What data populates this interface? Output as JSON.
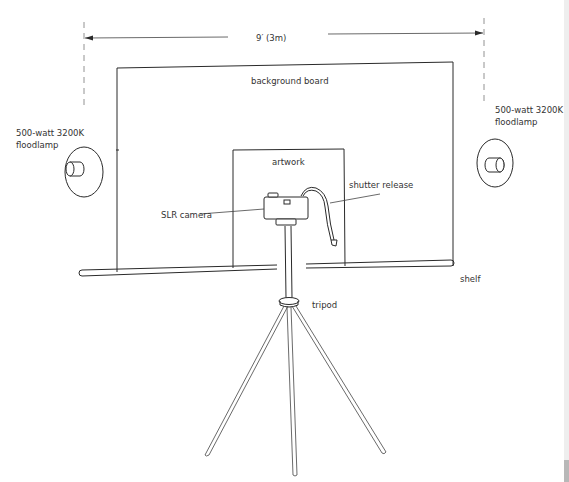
{
  "diagram": {
    "dimension": {
      "label": "9′ (3m)"
    },
    "labels": {
      "background_board": "background board",
      "artwork": "artwork",
      "slr_camera": "SLR camera",
      "shutter_release": "shutter release",
      "shelf": "shelf",
      "tripod": "tripod",
      "left_lamp_line1": "500-watt 3200K",
      "left_lamp_line2": "floodlamp",
      "right_lamp_line1": "500-watt 3200K",
      "right_lamp_line2": "floodlamp"
    },
    "colors": {
      "line": "#2a2a2a",
      "text": "#333333",
      "background": "#ffffff",
      "scrollbar_track": "#eeeeee",
      "scrollbar_thumb": "#b8b8b8"
    }
  }
}
